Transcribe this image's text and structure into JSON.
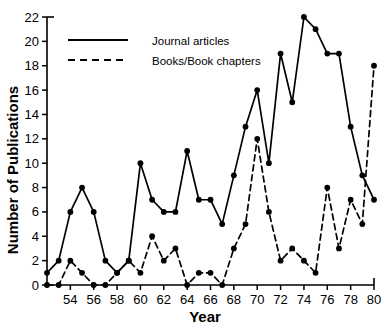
{
  "chart_data": {
    "type": "line",
    "title": "",
    "xlabel": "Year",
    "ylabel": "Number of Publications",
    "xlim": [
      52,
      80
    ],
    "ylim": [
      0,
      22
    ],
    "xticks": [
      54,
      56,
      58,
      60,
      62,
      64,
      66,
      68,
      70,
      72,
      74,
      76,
      78,
      80
    ],
    "yticks": [
      0,
      2,
      4,
      6,
      8,
      10,
      12,
      14,
      16,
      18,
      20,
      22
    ],
    "grid": false,
    "legend_position": "top-left",
    "x": [
      52,
      53,
      54,
      55,
      56,
      57,
      58,
      59,
      60,
      61,
      62,
      63,
      64,
      65,
      66,
      67,
      68,
      69,
      70,
      71,
      72,
      73,
      74,
      75,
      76,
      77,
      78,
      79,
      80
    ],
    "series": [
      {
        "name": "Journal articles",
        "style": "solid",
        "marker": "filled-circle",
        "values": [
          1,
          2,
          6,
          8,
          6,
          2,
          1,
          2,
          10,
          7,
          6,
          6,
          11,
          7,
          7,
          5,
          9,
          13,
          16,
          10,
          19,
          15,
          22,
          21,
          19,
          19,
          13,
          9,
          7
        ]
      },
      {
        "name": "Books/Book chapters",
        "style": "dashed",
        "marker": "filled-circle",
        "values": [
          0,
          0,
          2,
          1,
          0,
          0,
          1,
          2,
          1,
          4,
          2,
          3,
          0,
          1,
          1,
          0,
          3,
          5,
          12,
          6,
          2,
          3,
          2,
          1,
          8,
          3,
          7,
          5,
          18
        ]
      }
    ]
  },
  "legend": {
    "items": [
      {
        "label": "Journal articles",
        "style": "solid"
      },
      {
        "label": "Books/Book chapters",
        "style": "dashed"
      }
    ]
  }
}
